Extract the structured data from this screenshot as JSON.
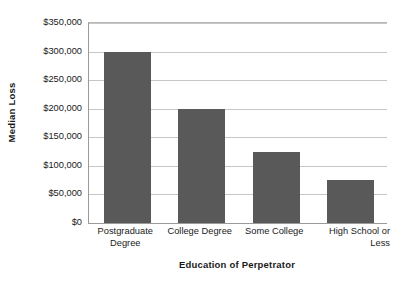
{
  "chart_data": {
    "type": "bar",
    "title": "",
    "subtitle": "",
    "xlabel": "Education of Perpetrator",
    "ylabel": "Median Loss",
    "categories": [
      "Postgraduate Degree",
      "College Degree",
      "Some College",
      "High School or Less"
    ],
    "category_lines": [
      [
        "Postgraduate",
        "Degree"
      ],
      [
        "College Degree"
      ],
      [
        "Some College"
      ],
      [
        "High School or",
        "Less"
      ]
    ],
    "values": [
      300000,
      200000,
      125000,
      75000
    ],
    "value_labels": [
      "$300,000",
      "$200,000",
      "$125,000",
      "$75,000"
    ],
    "ylim": [
      0,
      350000
    ],
    "ytick_values": [
      0,
      50000,
      100000,
      150000,
      200000,
      250000,
      300000,
      350000
    ],
    "ytick_labels": [
      "$0",
      "$50,000",
      "$100,000",
      "$150,000",
      "$200,000",
      "$250,000",
      "$300,000",
      "$350,000"
    ],
    "grid": true,
    "grid_axis": "y",
    "legend": false,
    "legend_position": "none",
    "bar_color": "#595959",
    "grid_color": "#c6c6c6",
    "axis_color": "#9a9a9a",
    "background_color": "#ffffff",
    "text_color": "#1a1a1a"
  }
}
